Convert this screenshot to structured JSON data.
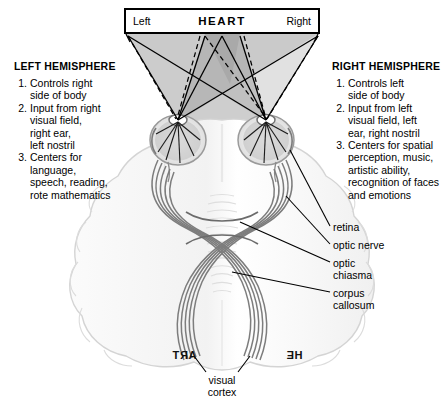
{
  "figure": {
    "background_color": "#ffffff"
  },
  "stimulus_box": {
    "left_label": "Left",
    "center_word": "HEART",
    "right_label": "Right",
    "border_color": "#000000"
  },
  "left_hemisphere": {
    "title": "LEFT HEMISPHERE",
    "items": [
      {
        "num": "1.",
        "lines": [
          "Controls right",
          "side of body"
        ]
      },
      {
        "num": "2.",
        "lines": [
          "Input from right",
          "visual field,",
          "right ear,",
          "left nostril"
        ]
      },
      {
        "num": "3.",
        "lines": [
          "Centers for",
          "language,",
          "speech, reading,",
          "rote mathematics"
        ]
      }
    ]
  },
  "right_hemisphere": {
    "title": "RIGHT HEMISPHERE",
    "items": [
      {
        "num": "1.",
        "lines": [
          "Controls left",
          "side of body"
        ]
      },
      {
        "num": "2.",
        "lines": [
          "Input from left",
          "visual field, left",
          "ear, right nostril"
        ]
      },
      {
        "num": "3.",
        "lines": [
          "Centers for spatial",
          "perception, music,",
          "artistic ability,",
          "recognition of faces",
          "and emotions"
        ]
      }
    ]
  },
  "callouts": {
    "retina": "retina",
    "optic_nerve": "optic nerve",
    "optic_chiasma_line1": "optic",
    "optic_chiasma_line2": "chiasma",
    "corpus_callosum_line1": "corpus",
    "corpus_callosum_line2": "callosum"
  },
  "projected_fragments": {
    "left_occipital": "ART",
    "right_occipital": "HE",
    "note": "mirror-reversed text as projected on visual cortex"
  },
  "visual_cortex": {
    "line1": "visual",
    "line2": "cortex"
  },
  "colors": {
    "visual_field_light": "#c9c9c9",
    "visual_field_overlap": "#a5a5a5",
    "brain_fill": "#f4f4f4",
    "brain_stroke": "#d0d0d0",
    "nerve_stroke": "#6f6f6f",
    "ray_solid": "#000000",
    "ray_dashed": "#000000",
    "text": "#000000"
  }
}
